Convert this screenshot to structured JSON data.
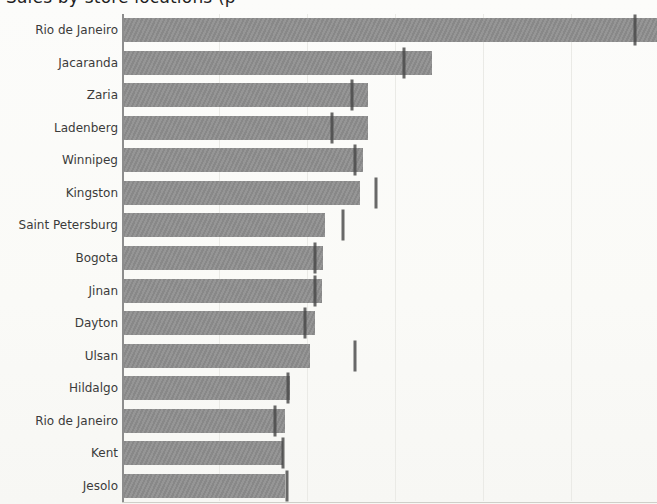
{
  "title": {
    "text": "Sales by store locations (p",
    "clipped_at_top": true
  },
  "chart_data": {
    "type": "bar",
    "orientation": "horizontal",
    "title": "Sales by store locations (p",
    "xlabel": "",
    "ylabel": "",
    "grid": true,
    "legend": false,
    "axis_value_labels_visible": false,
    "categories": [
      "Rio de Janeiro",
      "Jacaranda",
      "Zaria",
      "Ladenberg",
      "Winnipeg",
      "Kingston",
      "Saint Petersburg",
      "Bogota",
      "Jinan",
      "Dayton",
      "Ulsan",
      "Hildalgo",
      "Rio de Janeiro",
      "Kent",
      "Jesolo"
    ],
    "series": [
      {
        "name": "bar-length-px-from-axis",
        "values": [
          533,
          308,
          244,
          244,
          239,
          236,
          201,
          199,
          198,
          191,
          186,
          166,
          161,
          159,
          161
        ]
      },
      {
        "name": "error-tick-offset-px-from-axis",
        "values": [
          511,
          280,
          228,
          208,
          231,
          252,
          219,
          191,
          191,
          181,
          231,
          164,
          151,
          159,
          163
        ]
      }
    ],
    "first_bar_clipped_at_right_edge": true,
    "gridline_offsets_px": [
      95,
      183,
      271,
      359,
      447
    ],
    "plot_px": {
      "axis_x": 124,
      "top": 14,
      "bottom": 502,
      "right": 657,
      "bar_height": 24
    }
  },
  "colors": {
    "background": "#fbfbf8",
    "bar": "#909090",
    "error_tick": "#484848",
    "grid": "#eaeae6",
    "y_spine": "#8d8d8d",
    "x_spine": "#cfcfc9",
    "label": "#3b3b3b",
    "title": "#1f1f1f"
  }
}
